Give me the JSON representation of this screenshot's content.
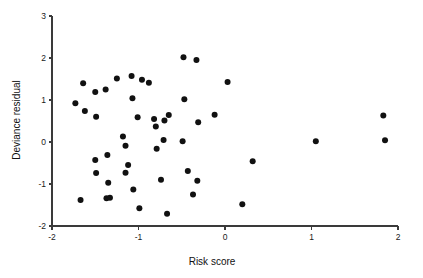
{
  "chart_data": {
    "type": "scatter",
    "title": "",
    "xlabel": "Risk score",
    "ylabel": "Deviance residual",
    "xlim": [
      -2,
      2
    ],
    "ylim": [
      -2,
      3
    ],
    "xticks": [
      -2,
      -1,
      0,
      1,
      2
    ],
    "yticks": [
      -2,
      -1,
      0,
      1,
      2,
      3
    ],
    "xticklabels": [
      "-2",
      "-1",
      "0",
      "1",
      "2"
    ],
    "yticklabels": [
      "-2",
      "-1",
      "0",
      "1",
      "2",
      "3"
    ],
    "grid": false,
    "legend": null,
    "marker": {
      "shape": "circle",
      "color": "#111111",
      "size": 3.0
    },
    "points": [
      {
        "x": -1.73,
        "y": 0.92
      },
      {
        "x": -1.64,
        "y": 1.4
      },
      {
        "x": -1.62,
        "y": 0.74
      },
      {
        "x": -1.5,
        "y": 1.19
      },
      {
        "x": -1.49,
        "y": 0.6
      },
      {
        "x": -1.5,
        "y": -0.43
      },
      {
        "x": -1.49,
        "y": -0.74
      },
      {
        "x": -1.67,
        "y": -1.38
      },
      {
        "x": -1.38,
        "y": 1.25
      },
      {
        "x": -1.36,
        "y": -0.31
      },
      {
        "x": -1.35,
        "y": -0.97
      },
      {
        "x": -1.37,
        "y": -1.34
      },
      {
        "x": -1.33,
        "y": -1.33
      },
      {
        "x": -1.25,
        "y": 1.51
      },
      {
        "x": -1.18,
        "y": 0.13
      },
      {
        "x": -1.15,
        "y": -0.09
      },
      {
        "x": -1.15,
        "y": -0.73
      },
      {
        "x": -1.12,
        "y": -0.55
      },
      {
        "x": -1.08,
        "y": 1.57
      },
      {
        "x": -1.07,
        "y": 1.04
      },
      {
        "x": -1.06,
        "y": -1.13
      },
      {
        "x": -1.01,
        "y": 0.59
      },
      {
        "x": -0.96,
        "y": 1.48
      },
      {
        "x": -0.99,
        "y": -1.58
      },
      {
        "x": -0.88,
        "y": 1.41
      },
      {
        "x": -0.82,
        "y": 0.55
      },
      {
        "x": -0.8,
        "y": 0.37
      },
      {
        "x": -0.79,
        "y": -0.16
      },
      {
        "x": -0.74,
        "y": -0.9
      },
      {
        "x": -0.7,
        "y": 0.51
      },
      {
        "x": -0.71,
        "y": 0.05
      },
      {
        "x": -0.65,
        "y": 0.64
      },
      {
        "x": -0.67,
        "y": -1.71
      },
      {
        "x": -0.48,
        "y": 2.02
      },
      {
        "x": -0.47,
        "y": 1.02
      },
      {
        "x": -0.49,
        "y": 0.02
      },
      {
        "x": -0.43,
        "y": -0.69
      },
      {
        "x": -0.37,
        "y": -1.25
      },
      {
        "x": -0.33,
        "y": 1.95
      },
      {
        "x": -0.31,
        "y": 0.47
      },
      {
        "x": -0.32,
        "y": -0.92
      },
      {
        "x": -0.12,
        "y": 0.65
      },
      {
        "x": 0.03,
        "y": 1.43
      },
      {
        "x": 0.2,
        "y": -1.48
      },
      {
        "x": 0.32,
        "y": -0.46
      },
      {
        "x": 1.05,
        "y": 0.02
      },
      {
        "x": 1.83,
        "y": 0.63
      },
      {
        "x": 1.85,
        "y": 0.04
      }
    ]
  },
  "axes": {
    "x_axis_label": "Risk score",
    "y_axis_label": "Deviance residual"
  }
}
